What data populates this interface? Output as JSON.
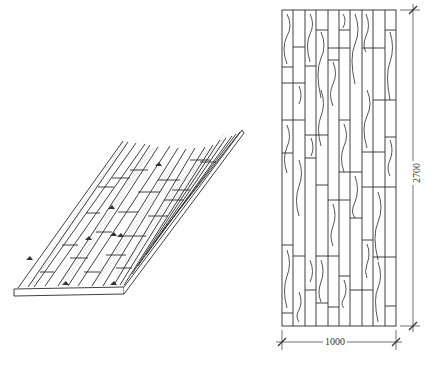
{
  "figure": {
    "type": "technical-drawing",
    "views": [
      {
        "id": "isometric",
        "label": "isometric view of panel with stippled strips"
      },
      {
        "id": "elevation",
        "label": "front elevation of panel"
      }
    ]
  },
  "dimensions": {
    "height": {
      "value": "2700",
      "orientation": "vertical"
    },
    "width": {
      "value": "1000",
      "orientation": "horizontal"
    }
  },
  "colors": {
    "line": "#2a2a2a",
    "stipple": "#555555",
    "background": "#ffffff"
  }
}
